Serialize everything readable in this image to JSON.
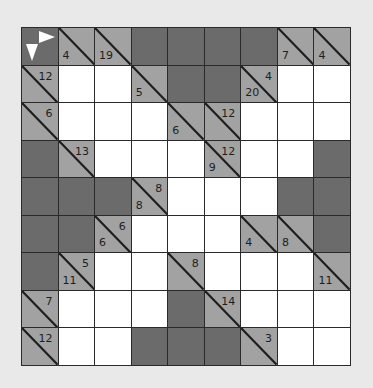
{
  "puzzle": {
    "type": "kakuro",
    "rows": 9,
    "cols": 9,
    "colors": {
      "background": "#e9e9e9",
      "dark_cell": "#6b6b6b",
      "clue_cell": "#a2a2a2",
      "white_cell": "#ffffff",
      "grid_line": "#2a2a2a"
    },
    "legend_corner": {
      "icons": [
        "arrow-right-icon",
        "arrow-down-icon"
      ]
    },
    "grid": [
      [
        {
          "t": "corner"
        },
        {
          "t": "clue",
          "down": "4"
        },
        {
          "t": "clue",
          "down": "19"
        },
        {
          "t": "dark"
        },
        {
          "t": "dark"
        },
        {
          "t": "dark"
        },
        {
          "t": "dark"
        },
        {
          "t": "clue",
          "down": "7"
        },
        {
          "t": "clue",
          "down": "4"
        }
      ],
      [
        {
          "t": "clue",
          "right": "12"
        },
        {
          "t": "white"
        },
        {
          "t": "white"
        },
        {
          "t": "clue",
          "down": "5"
        },
        {
          "t": "dark"
        },
        {
          "t": "dark"
        },
        {
          "t": "clue",
          "down": "20",
          "right": "4"
        },
        {
          "t": "white"
        },
        {
          "t": "white"
        }
      ],
      [
        {
          "t": "clue",
          "right": "6"
        },
        {
          "t": "white"
        },
        {
          "t": "white"
        },
        {
          "t": "white"
        },
        {
          "t": "clue",
          "down": "6"
        },
        {
          "t": "clue",
          "right": "12"
        },
        {
          "t": "white"
        },
        {
          "t": "white"
        },
        {
          "t": "white"
        }
      ],
      [
        {
          "t": "dark"
        },
        {
          "t": "clue",
          "right": "13"
        },
        {
          "t": "white"
        },
        {
          "t": "white"
        },
        {
          "t": "white"
        },
        {
          "t": "clue",
          "down": "9",
          "right": "12"
        },
        {
          "t": "white"
        },
        {
          "t": "white"
        },
        {
          "t": "dark"
        }
      ],
      [
        {
          "t": "dark"
        },
        {
          "t": "dark"
        },
        {
          "t": "dark"
        },
        {
          "t": "clue",
          "down": "8",
          "right": "8"
        },
        {
          "t": "white"
        },
        {
          "t": "white"
        },
        {
          "t": "white"
        },
        {
          "t": "dark"
        },
        {
          "t": "dark"
        }
      ],
      [
        {
          "t": "dark"
        },
        {
          "t": "dark"
        },
        {
          "t": "clue",
          "down": "6",
          "right": "6"
        },
        {
          "t": "white"
        },
        {
          "t": "white"
        },
        {
          "t": "white"
        },
        {
          "t": "clue",
          "down": "4"
        },
        {
          "t": "clue",
          "down": "8"
        },
        {
          "t": "dark"
        }
      ],
      [
        {
          "t": "dark"
        },
        {
          "t": "clue",
          "down": "11",
          "right": "5"
        },
        {
          "t": "white"
        },
        {
          "t": "white"
        },
        {
          "t": "clue",
          "right": "8"
        },
        {
          "t": "white"
        },
        {
          "t": "white"
        },
        {
          "t": "white"
        },
        {
          "t": "clue",
          "down": "11"
        }
      ],
      [
        {
          "t": "clue",
          "right": "7"
        },
        {
          "t": "white"
        },
        {
          "t": "white"
        },
        {
          "t": "white"
        },
        {
          "t": "dark"
        },
        {
          "t": "clue",
          "right": "14"
        },
        {
          "t": "white"
        },
        {
          "t": "white"
        },
        {
          "t": "white"
        }
      ],
      [
        {
          "t": "clue",
          "right": "12"
        },
        {
          "t": "white"
        },
        {
          "t": "white"
        },
        {
          "t": "dark"
        },
        {
          "t": "dark"
        },
        {
          "t": "dark"
        },
        {
          "t": "clue",
          "right": "3"
        },
        {
          "t": "white"
        },
        {
          "t": "white"
        }
      ]
    ]
  }
}
